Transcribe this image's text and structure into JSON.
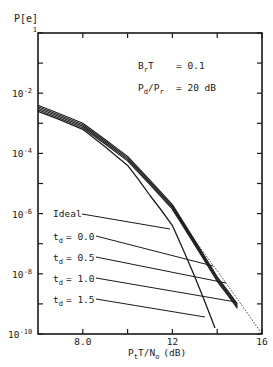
{
  "chart_data": {
    "type": "line",
    "title": "",
    "ylabel": "P[e]",
    "xlabel": "PtT/No (dB)",
    "xlabel_parts": {
      "main": "P",
      "sub1": "t",
      "mid": "T/N",
      "sub2": "o",
      "unit": "(dB)"
    },
    "xlim": [
      6,
      16
    ],
    "ylim_log10": [
      -10,
      0
    ],
    "x_ticks": [
      {
        "value": 8,
        "label": "8.0"
      },
      {
        "value": 10,
        "label": ""
      },
      {
        "value": 12,
        "label": "12"
      },
      {
        "value": 14,
        "label": ""
      },
      {
        "value": 16,
        "label": "16"
      }
    ],
    "y_ticks": [
      {
        "exp": 0,
        "label": "1"
      },
      {
        "exp": -1,
        "label": ""
      },
      {
        "exp": -2,
        "label": "10",
        "sup": "-2"
      },
      {
        "exp": -3,
        "label": ""
      },
      {
        "exp": -4,
        "label": "10",
        "sup": "-4"
      },
      {
        "exp": -5,
        "label": ""
      },
      {
        "exp": -6,
        "label": "10",
        "sup": "-6"
      },
      {
        "exp": -7,
        "label": ""
      },
      {
        "exp": -8,
        "label": "10",
        "sup": "-8"
      },
      {
        "exp": -9,
        "label": ""
      },
      {
        "exp": -10,
        "label": "10",
        "sup": "-10"
      }
    ],
    "annotations": {
      "param1": {
        "label": "BrT",
        "value": "= 0.1"
      },
      "param2": {
        "label": "Pd/Pr",
        "value": "= 20 dB"
      }
    },
    "series": [
      {
        "name": "Ideal",
        "style": "solid",
        "x": [
          6.0,
          8.0,
          10.0,
          11.0,
          12.0,
          13.0,
          13.9
        ],
        "log10_y": [
          -2.6,
          -3.2,
          -4.4,
          -5.4,
          -6.4,
          -8.1,
          -9.8
        ]
      },
      {
        "name": "td = 0.0",
        "style": "solid",
        "x": [
          6.0,
          8.0,
          10.0,
          12.0,
          14.0,
          14.9
        ],
        "log10_y": [
          -2.4,
          -3.0,
          -4.1,
          -5.7,
          -8.1,
          -9.0
        ]
      },
      {
        "name": "td = 0.5",
        "style": "solid",
        "x": [
          6.0,
          8.0,
          10.0,
          12.0,
          14.0,
          14.9
        ],
        "log10_y": [
          -2.45,
          -3.05,
          -4.15,
          -5.75,
          -8.15,
          -9.05
        ]
      },
      {
        "name": "td = 1.0",
        "style": "solid",
        "x": [
          6.0,
          8.0,
          10.0,
          12.0,
          14.0,
          14.9
        ],
        "log10_y": [
          -2.5,
          -3.1,
          -4.2,
          -5.8,
          -8.2,
          -9.1
        ]
      },
      {
        "name": "td = 1.5",
        "style": "solid",
        "x": [
          6.0,
          8.0,
          10.0,
          12.0,
          14.0,
          14.9
        ],
        "log10_y": [
          -2.55,
          -3.15,
          -4.25,
          -5.85,
          -8.25,
          -9.15
        ]
      },
      {
        "name": "bound",
        "style": "dotted",
        "x": [
          12.0,
          14.0,
          16.0
        ],
        "log10_y": [
          -5.9,
          -7.9,
          -10.0
        ]
      }
    ],
    "legend_labels": [
      {
        "text": "Ideal"
      },
      {
        "text": "t",
        "sub": "d",
        "value": "= 0.0"
      },
      {
        "text": "t",
        "sub": "d",
        "value": "= 0.5"
      },
      {
        "text": "t",
        "sub": "d",
        "value": "= 1.0"
      },
      {
        "text": "t",
        "sub": "d",
        "value": "= 1.5"
      }
    ],
    "grid": false
  }
}
